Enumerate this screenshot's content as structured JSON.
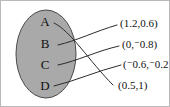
{
  "diagram": {
    "type": "mapping-diagram",
    "title": "",
    "background_color": "#ffffff",
    "border_color": "#b9b9b9",
    "domain_set": {
      "shape": "ellipse",
      "fill_color": "#a9a9a9",
      "stroke_color": "#4a4a4a",
      "elements": [
        {
          "id": "A",
          "label": "A"
        },
        {
          "id": "B",
          "label": "B"
        },
        {
          "id": "C",
          "label": "C"
        },
        {
          "id": "D",
          "label": "D"
        }
      ]
    },
    "range_set": {
      "elements": [
        {
          "id": "p1",
          "label": "(1.2,0.6)",
          "x": "1.2",
          "y": "0.6",
          "x_negative": false,
          "y_negative": false
        },
        {
          "id": "p2",
          "label": "(0,⁻0.8)",
          "x": "0",
          "y": "0.8",
          "x_negative": false,
          "y_negative": true
        },
        {
          "id": "p3",
          "label": "(⁻0.6,⁻0.2)",
          "x": "0.6",
          "y": "0.2",
          "x_negative": true,
          "y_negative": true
        },
        {
          "id": "p4",
          "label": "(0.5,1)",
          "x": "0.5",
          "y": "1",
          "x_negative": false,
          "y_negative": false
        }
      ]
    },
    "connections": [
      {
        "from": "A",
        "to": "p4"
      },
      {
        "from": "B",
        "to": "p1"
      },
      {
        "from": "C",
        "to": "p2"
      },
      {
        "from": "D",
        "to": "p3"
      }
    ],
    "negative_sign_glyph": "⁻"
  }
}
